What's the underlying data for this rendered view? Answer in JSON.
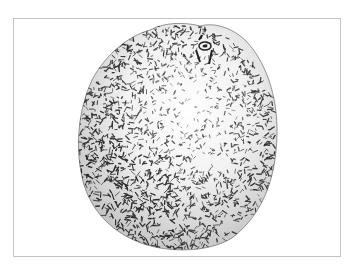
{
  "image": {
    "subject": "pencil stipple drawing of a round citrus fruit",
    "background_color": "#ffffff",
    "frame_color": "#c4c4c4",
    "ink_color": "#2a2a2a"
  },
  "fruit": {
    "cx": 177,
    "cy": 137,
    "rx": 99,
    "ry": 112,
    "stem": {
      "x": 205,
      "y": 48
    }
  }
}
